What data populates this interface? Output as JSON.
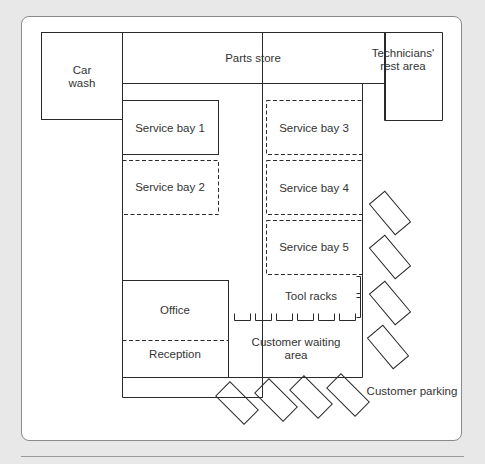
{
  "diagram": {
    "type": "floor-plan",
    "colors": {
      "line": "#2a2a2a",
      "background": "#ffffff",
      "page": "#e8e8e8",
      "text": "#333333"
    },
    "rooms": [
      {
        "id": "car-wash",
        "lines": [
          "Car",
          "wash"
        ],
        "border": "solid"
      },
      {
        "id": "parts-store",
        "lines": [
          "Parts store"
        ],
        "border": "solid"
      },
      {
        "id": "technicians-rest-area",
        "lines": [
          "Technicians'",
          "rest area"
        ],
        "border": "solid"
      },
      {
        "id": "service-bay-1",
        "lines": [
          "Service bay 1"
        ],
        "border": "solid"
      },
      {
        "id": "service-bay-2",
        "lines": [
          "Service bay 2"
        ],
        "border": "dashed"
      },
      {
        "id": "service-bay-3",
        "lines": [
          "Service bay 3"
        ],
        "border": "dashed"
      },
      {
        "id": "service-bay-4",
        "lines": [
          "Service bay 4"
        ],
        "border": "dashed"
      },
      {
        "id": "service-bay-5",
        "lines": [
          "Service bay 5"
        ],
        "border": "dashed"
      },
      {
        "id": "tool-racks",
        "lines": [
          "Tool racks"
        ],
        "border": "none"
      },
      {
        "id": "office",
        "lines": [
          "Office"
        ],
        "border": "solid"
      },
      {
        "id": "reception",
        "lines": [
          "Reception"
        ],
        "border": "dashed-top"
      },
      {
        "id": "customer-waiting-area",
        "lines": [
          "Customer waiting",
          "area"
        ],
        "border": "none"
      },
      {
        "id": "customer-parking",
        "lines": [
          "Customer parking"
        ],
        "border": "none"
      }
    ],
    "parking_spaces": {
      "right_column": 4,
      "bottom_row": 4
    },
    "tool_rack_units": 6
  }
}
